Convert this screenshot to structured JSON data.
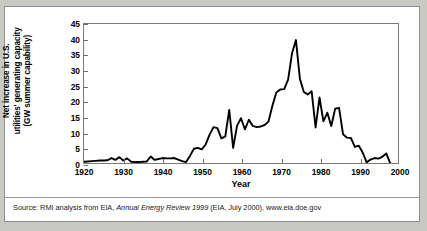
{
  "figure": {
    "ylabel": "Net increase in U.S.\nutilities' generating capacity\n(GW summer capability)",
    "xlabel": "Year",
    "source_prefix": "Source: RMI analysis from EIA, ",
    "source_italic": "Annual Energy Review 1999",
    "source_suffix": " (EIA, July 2000), www.eia.doe.gov"
  },
  "chart_data": {
    "type": "line",
    "title": "",
    "xlabel": "Year",
    "ylabel": "Net increase in U.S. utilities' generating capacity (GW summer capability)",
    "xlim": [
      1920,
      2000
    ],
    "ylim": [
      0,
      45
    ],
    "xticks": [
      1920,
      1930,
      1940,
      1950,
      1960,
      1970,
      1980,
      1990,
      2000
    ],
    "yticks": [
      0,
      5,
      10,
      15,
      20,
      25,
      30,
      35,
      40,
      45
    ],
    "grid": false,
    "legend": null,
    "line_color": "#000000",
    "x": [
      1920,
      1921,
      1922,
      1923,
      1924,
      1925,
      1926,
      1927,
      1928,
      1929,
      1930,
      1931,
      1932,
      1933,
      1934,
      1935,
      1936,
      1937,
      1938,
      1939,
      1940,
      1941,
      1942,
      1943,
      1944,
      1945,
      1946,
      1947,
      1948,
      1949,
      1950,
      1951,
      1952,
      1953,
      1954,
      1955,
      1956,
      1957,
      1958,
      1959,
      1960,
      1961,
      1962,
      1963,
      1964,
      1965,
      1966,
      1967,
      1968,
      1969,
      1970,
      1971,
      1972,
      1973,
      1974,
      1975,
      1976,
      1977,
      1978,
      1979,
      1980,
      1981,
      1982,
      1983,
      1984,
      1985,
      1986,
      1987,
      1988,
      1989,
      1990,
      1991,
      1992,
      1993,
      1994,
      1995,
      1996,
      1997,
      1998
    ],
    "values": [
      0.4,
      0.5,
      0.6,
      0.7,
      0.8,
      0.8,
      0.9,
      1.6,
      1.0,
      1.9,
      0.8,
      1.5,
      0.4,
      0.3,
      0.3,
      0.4,
      0.5,
      2.1,
      1.0,
      1.3,
      1.6,
      1.5,
      1.5,
      1.6,
      1.1,
      0.6,
      0.3,
      2.3,
      4.6,
      4.9,
      4.4,
      6.0,
      9.2,
      11.6,
      11.3,
      8.0,
      8.6,
      17.2,
      4.9,
      12.1,
      14.5,
      10.9,
      14.0,
      12.0,
      11.6,
      11.8,
      12.3,
      13.4,
      18.5,
      22.8,
      23.8,
      23.9,
      27.0,
      35.5,
      39.8,
      27.3,
      23.0,
      22.2,
      23.2,
      11.5,
      21.2,
      13.5,
      16.3,
      12.0,
      17.6,
      17.8,
      9.3,
      8.2,
      8.1,
      5.2,
      5.6,
      3.4,
      0.2,
      1.1,
      1.6,
      1.4,
      2.0,
      3.1,
      0.0
    ]
  }
}
